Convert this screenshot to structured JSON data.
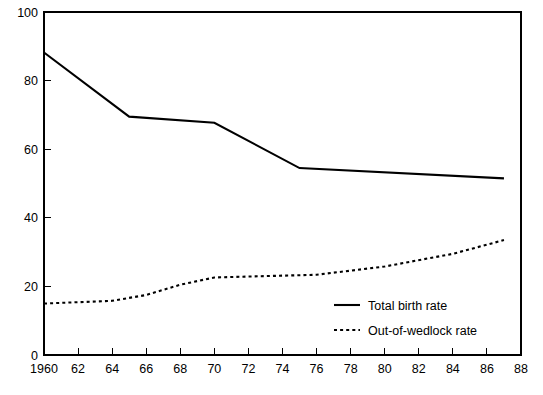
{
  "chart_data": {
    "type": "line",
    "title": "",
    "subtitle": "",
    "xlabel": "",
    "ylabel": "",
    "xlim": [
      1960,
      1988
    ],
    "ylim": [
      0,
      100
    ],
    "grid": false,
    "legend_position": "inside-lower-right",
    "x_tick_labels": [
      "1960",
      "62",
      "64",
      "66",
      "68",
      "70",
      "72",
      "74",
      "76",
      "78",
      "80",
      "82",
      "84",
      "86",
      "88"
    ],
    "x_tick_values": [
      1960,
      1962,
      1964,
      1966,
      1968,
      1970,
      1972,
      1974,
      1976,
      1978,
      1980,
      1982,
      1984,
      1986,
      1988
    ],
    "y_tick_labels": [
      "0",
      "20",
      "40",
      "60",
      "80",
      "100"
    ],
    "y_tick_values": [
      0,
      20,
      40,
      60,
      80,
      100
    ],
    "series": [
      {
        "name": "Total birth rate",
        "style": "solid",
        "color": "#000000",
        "x": [
          1960,
          1965,
          1970,
          1975,
          1987
        ],
        "values": [
          88.2,
          69.5,
          67.7,
          54.5,
          51.5
        ]
      },
      {
        "name": "Out-of-wedlock rate",
        "style": "dotted",
        "color": "#000000",
        "x": [
          1960,
          1964,
          1966,
          1968,
          1970,
          1973,
          1976,
          1980,
          1984,
          1987
        ],
        "values": [
          15.0,
          15.8,
          17.5,
          20.5,
          22.6,
          23.0,
          23.4,
          25.8,
          29.5,
          33.5
        ]
      }
    ]
  },
  "legend": {
    "items": [
      {
        "label": "Total birth rate",
        "style": "solid"
      },
      {
        "label": "Out-of-wedlock rate",
        "style": "dotted"
      }
    ]
  }
}
